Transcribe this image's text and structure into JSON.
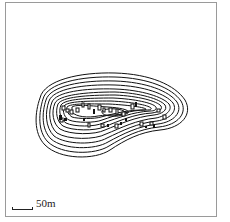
{
  "map": {
    "type": "contour map",
    "scale": {
      "label": "50m"
    },
    "colors": {
      "contour": "#111111",
      "frame": "#9a9a9a",
      "background": "#ffffff"
    },
    "contour_count": 13,
    "features": "rectangular structure markers clustered on mound summit"
  }
}
